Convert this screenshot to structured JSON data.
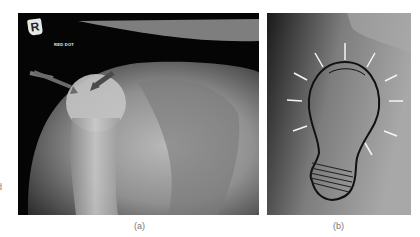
{
  "left_edge_fragment": "d",
  "panels": [
    {
      "id": "a",
      "caption": "(a)",
      "description": "Shoulder x-ray showing humeral head with two arrows",
      "marker_letter": "R",
      "film_label": "RED DOT",
      "arrow_color": "#5a5a5a"
    },
    {
      "id": "b",
      "caption": "(b)",
      "description": "Shoulder x-ray with humerus outlined as a glowing light bulb",
      "outline_color": "#111111",
      "ray_color": "#f5f5f5"
    }
  ]
}
